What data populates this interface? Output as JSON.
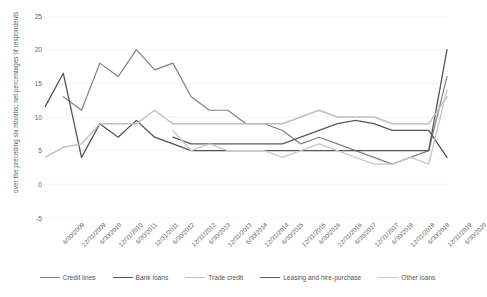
{
  "chart_data": {
    "type": "line",
    "title": "",
    "subtitle": "",
    "xlabel": "",
    "ylabel": "over the preceding six months; net percentages of respondents",
    "ylim": [
      -5,
      25
    ],
    "yticks": [
      25,
      20,
      15,
      10,
      5,
      0,
      -5
    ],
    "grid": true,
    "grid_axis": "y",
    "legend_position": "bottom",
    "x": [
      "6/30/2009",
      "12/31/2009",
      "6/30/2010",
      "12/31/2010",
      "6/30/2011",
      "12/31/2011",
      "6/30/2012",
      "12/31/2012",
      "6/30/2013",
      "12/31/2013",
      "6/30/2014",
      "12/31/2014",
      "6/30/2015",
      "12/31/2015",
      "6/30/2016",
      "12/31/2016",
      "6/30/2017",
      "12/31/2017",
      "6/30/2018",
      "12/31/2018",
      "6/30/2019",
      "12/31/2019",
      "6/30/2020"
    ],
    "series": [
      {
        "name": "Credit lines",
        "color": "#808080",
        "width": 1.2,
        "values": [
          null,
          13,
          11,
          18,
          16,
          20,
          17,
          18,
          13,
          11,
          11,
          9,
          9,
          8,
          6,
          7,
          6,
          5,
          4,
          3,
          4,
          5,
          16
        ]
      },
      {
        "name": "Bank loans",
        "color": "#545454",
        "width": 1.3,
        "values": [
          11.5,
          16.5,
          4,
          9,
          7,
          9.5,
          7,
          6,
          5,
          5,
          5,
          5,
          5,
          5,
          5,
          5,
          5,
          5,
          5,
          5,
          5,
          5,
          20
        ]
      },
      {
        "name": "Trade credit",
        "color": "#bfbfbf",
        "width": 1.4,
        "values": [
          4,
          5.5,
          6,
          9,
          9,
          9,
          11,
          9,
          9,
          9,
          9,
          9,
          9,
          9,
          10,
          11,
          10,
          10,
          10,
          9,
          9,
          9,
          13
        ]
      },
      {
        "name": "Leasing and hire-purchase",
        "color": "#595959",
        "width": 1.3,
        "values": [
          null,
          null,
          null,
          null,
          null,
          null,
          null,
          7,
          6,
          6,
          6,
          6,
          6,
          6,
          7,
          8,
          9,
          9.5,
          9,
          8,
          8,
          8,
          4
        ]
      },
      {
        "name": "Other loans",
        "color": "#c9c9c9",
        "width": 1.4,
        "values": [
          null,
          null,
          null,
          null,
          null,
          null,
          null,
          8,
          5,
          6,
          5,
          5,
          5,
          4,
          5,
          6,
          5,
          4,
          3,
          3,
          4,
          3,
          14
        ]
      }
    ]
  },
  "axis": {
    "y_title": "over the preceding six months; net percentages of respondents"
  },
  "colors": {
    "axis_text": "#606060",
    "gridline": "#f0f0f0",
    "background": "#ffffff"
  }
}
